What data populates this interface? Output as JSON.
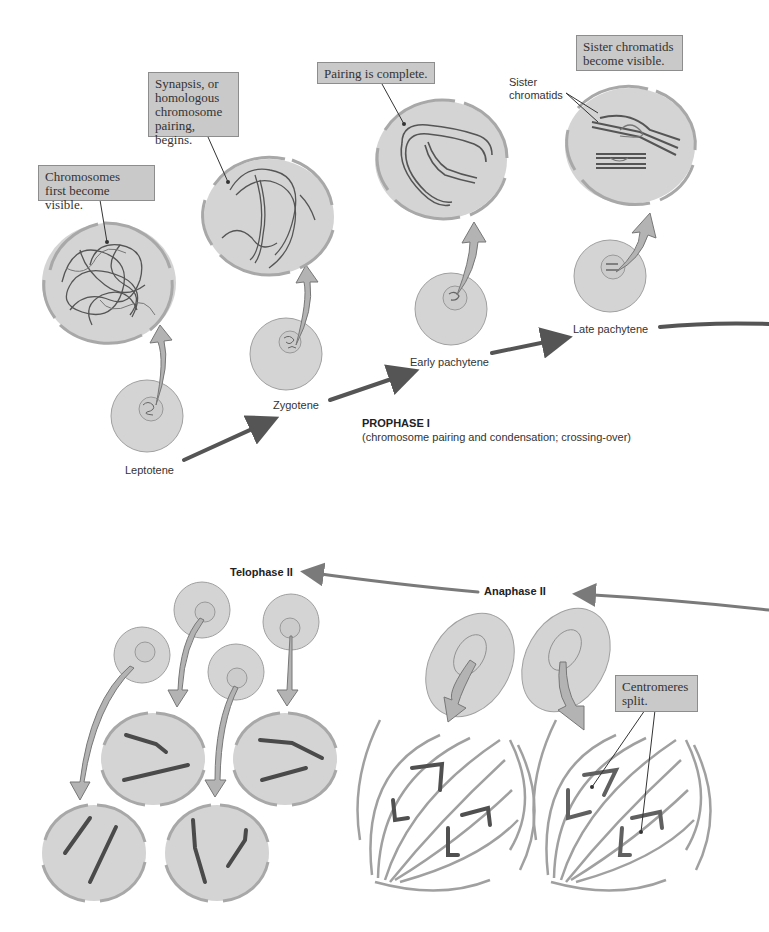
{
  "colors": {
    "cell_fill": "#d4d4d4",
    "cell_stroke": "#9a9a9a",
    "envelope": "#a8a8a8",
    "chromosome_dark": "#4a4a4a",
    "chromosome_mid": "#6e6e6e",
    "arrow_fill": "#b3b3b3",
    "progress_arrow": "#555555",
    "callout_bg": "#c9c9c9"
  },
  "prophase": {
    "title": "PROPHASE I",
    "subtitle": "(chromosome pairing and condensation; crossing-over)",
    "stages": [
      {
        "label": "Leptotene",
        "callout": "Chromosomes\nfirst become visible."
      },
      {
        "label": "Zygotene",
        "callout": "Synapsis, or\nhomologous\nchromosome\npairing, begins."
      },
      {
        "label": "Early pachytene",
        "callout": "Pairing is complete."
      },
      {
        "label": "Late pachytene",
        "callout": "Sister chromatids\nbecome visible.",
        "pointer_label": "Sister\nchromatids"
      }
    ]
  },
  "meiosis_ii": {
    "anaphase": {
      "label": "Anaphase II",
      "callout": "Centromeres\nsplit."
    },
    "telophase": {
      "label": "Telophase II"
    }
  }
}
